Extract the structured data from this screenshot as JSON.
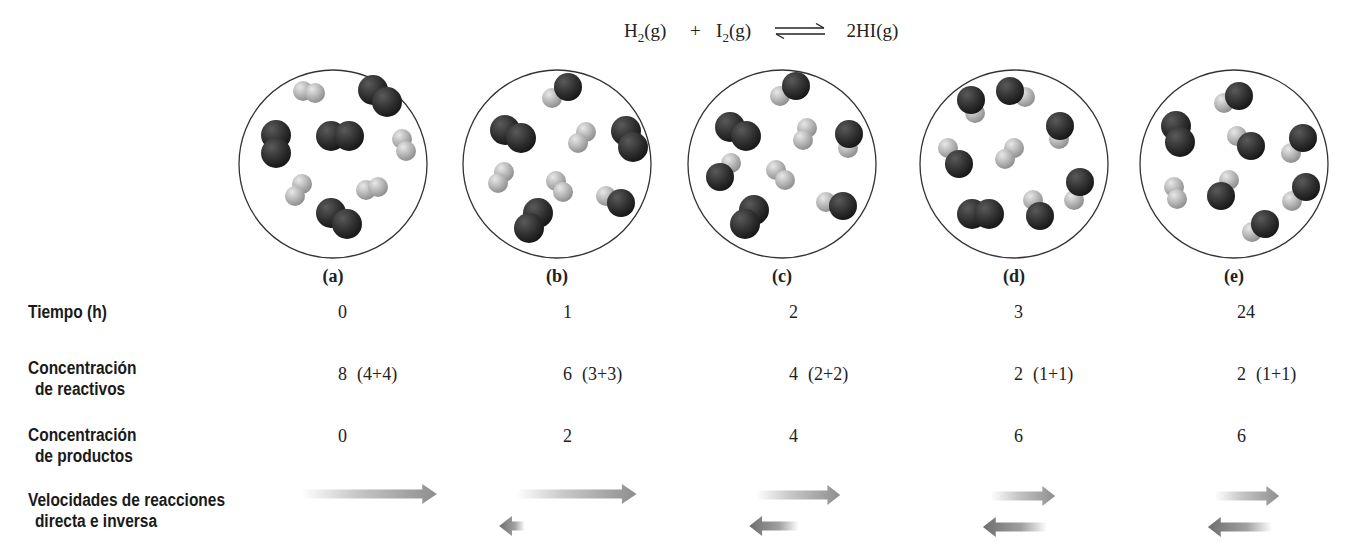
{
  "equation": {
    "h2": "H",
    "h2_sub": "2",
    "h2_state": "(g)",
    "plus": "+",
    "i2": "I",
    "i2_sub": "2",
    "i2_state": "(g)",
    "product": "2HI",
    "product_state": "(g)",
    "arrow": "equilibrium-arrow"
  },
  "panels": [
    {
      "label": "(a)",
      "time": "0",
      "reactants": "8",
      "reactants_breakdown": "(4+4)",
      "products": "0",
      "forward_rate_len": 150,
      "reverse_rate_len": 0
    },
    {
      "label": "(b)",
      "time": "1",
      "reactants": "6",
      "reactants_breakdown": "(3+3)",
      "products": "2",
      "forward_rate_len": 130,
      "reverse_rate_len": 25
    },
    {
      "label": "(c)",
      "time": "2",
      "reactants": "4",
      "reactants_breakdown": "(2+2)",
      "products": "4",
      "forward_rate_len": 90,
      "reverse_rate_len": 50
    },
    {
      "label": "(d)",
      "time": "3",
      "reactants": "2",
      "reactants_breakdown": "(1+1)",
      "products": "6",
      "forward_rate_len": 70,
      "reverse_rate_len": 68
    },
    {
      "label": "(e)",
      "time": "24",
      "reactants": "2",
      "reactants_breakdown": "(1+1)",
      "products": "6",
      "forward_rate_len": 70,
      "reverse_rate_len": 68
    }
  ],
  "rows": {
    "time": "Tiempo (h)",
    "reactants_line1": "Concentración",
    "reactants_line2": "de reactivos",
    "products_line1": "Concentración",
    "products_line2": "de productos",
    "rates_line1": "Velocidades de reacciones",
    "rates_line2": "directa e inversa"
  },
  "legend": {
    "H2": "light gray diatomic",
    "I2": "dark gray diatomic",
    "HI": "dark + light heteronuclear"
  },
  "colors": {
    "I_atom": "#2e2e2e",
    "H_atom": "#b8b8b8",
    "circle_stroke": "#333333",
    "arrow": "#8a8a8a"
  }
}
